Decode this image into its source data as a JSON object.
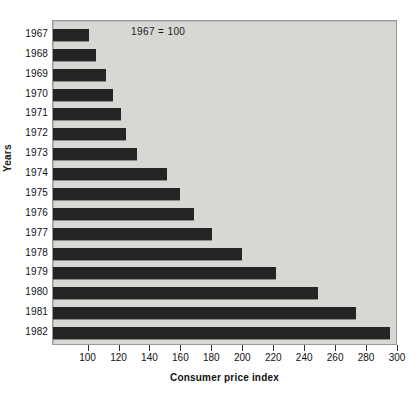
{
  "chart_data": {
    "type": "bar",
    "orientation": "horizontal",
    "title": "",
    "xlabel": "Consumer price index",
    "ylabel": "Years",
    "annotation": "1967  =  100",
    "xlim": [
      77,
      300
    ],
    "ylim": null,
    "grid": false,
    "legend": null,
    "x_ticks": [
      100,
      120,
      140,
      160,
      180,
      200,
      220,
      240,
      260,
      280,
      300
    ],
    "x_tick_labels": [
      "100",
      "120",
      "140",
      "160",
      "180",
      "200",
      "220",
      "240",
      "260",
      "280",
      "300"
    ],
    "categories": [
      "1967",
      "1968",
      "1969",
      "1970",
      "1971",
      "1972",
      "1973",
      "1974",
      "1975",
      "1976",
      "1977",
      "1978",
      "1979",
      "1980",
      "1981",
      "1982"
    ],
    "values": [
      100,
      105,
      111,
      116,
      121,
      124,
      131,
      151,
      159,
      168,
      180,
      199,
      221,
      248,
      273,
      295
    ],
    "bar_color": "#242424",
    "panel_color": "#d7d7d4"
  }
}
